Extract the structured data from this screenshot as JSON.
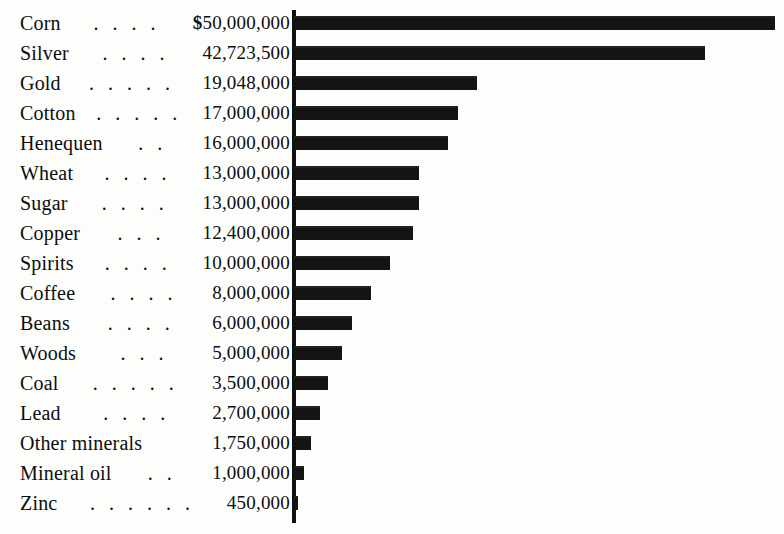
{
  "chart_data": {
    "type": "bar",
    "orientation": "horizontal",
    "title": "",
    "subtitle": "",
    "xlabel": "",
    "ylabel": "",
    "currency_symbol": "$",
    "xlim": [
      0,
      50000000
    ],
    "grid": false,
    "legend": false,
    "axis_baseline_color": "#141414",
    "bar_color": "#141414",
    "categories": [
      "Corn",
      "Silver",
      "Gold",
      "Cotton",
      "Henequen",
      "Wheat",
      "Sugar",
      "Copper",
      "Spirits",
      "Coffee",
      "Beans",
      "Woods",
      "Coal",
      "Lead",
      "Other minerals",
      "Mineral oil",
      "Zinc"
    ],
    "values": [
      50000000,
      42723500,
      19048000,
      17000000,
      16000000,
      13000000,
      13000000,
      12400000,
      10000000,
      8000000,
      6000000,
      5000000,
      3500000,
      2700000,
      1750000,
      1000000,
      450000
    ],
    "value_labels": [
      "50,000,000",
      "42,723,500",
      "19,048,000",
      "17,000,000",
      "16,000,000",
      "13,000,000",
      "13,000,000",
      "12,400,000",
      "10,000,000",
      "8,000,000",
      "6,000,000",
      "5,000,000",
      "3,500,000",
      "2,700,000",
      "1,750,000",
      "1,000,000",
      "450,000"
    ],
    "leader_dots": [
      ". . . .",
      ". . . .",
      ". . . . .",
      ". . . . .",
      ". .",
      ". . . .",
      ". . . .",
      ". . .",
      ". . . .",
      ". . . .",
      ". . . .",
      ". . .",
      ". . . . .",
      ". . . .",
      "",
      ". .",
      ". . . . . ."
    ],
    "rows": [
      {
        "label": "Corn",
        "leaders": ". . . .",
        "currency": "$",
        "value_label": "50,000,000",
        "value": 50000000
      },
      {
        "label": "Silver",
        "leaders": ". . . .",
        "currency": "",
        "value_label": "42,723,500",
        "value": 42723500
      },
      {
        "label": "Gold",
        "leaders": ". . . . .",
        "currency": "",
        "value_label": "19,048,000",
        "value": 19048000
      },
      {
        "label": "Cotton",
        "leaders": ". . . . .",
        "currency": "",
        "value_label": "17,000,000",
        "value": 17000000
      },
      {
        "label": "Henequen",
        "leaders": ". .",
        "currency": "",
        "value_label": "16,000,000",
        "value": 16000000
      },
      {
        "label": "Wheat",
        "leaders": ". . . .",
        "currency": "",
        "value_label": "13,000,000",
        "value": 13000000
      },
      {
        "label": "Sugar",
        "leaders": ". . . .",
        "currency": "",
        "value_label": "13,000,000",
        "value": 13000000
      },
      {
        "label": "Copper",
        "leaders": ". . .",
        "currency": "",
        "value_label": "12,400,000",
        "value": 12400000
      },
      {
        "label": "Spirits",
        "leaders": ". . . .",
        "currency": "",
        "value_label": "10,000,000",
        "value": 10000000
      },
      {
        "label": "Coffee",
        "leaders": ". . . .",
        "currency": "",
        "value_label": "8,000,000",
        "value": 8000000
      },
      {
        "label": "Beans",
        "leaders": ". . . .",
        "currency": "",
        "value_label": "6,000,000",
        "value": 6000000
      },
      {
        "label": "Woods",
        "leaders": ". . .",
        "currency": "",
        "value_label": "5,000,000",
        "value": 5000000
      },
      {
        "label": "Coal",
        "leaders": ". . . . .",
        "currency": "",
        "value_label": "3,500,000",
        "value": 3500000
      },
      {
        "label": "Lead",
        "leaders": ". . . .",
        "currency": "",
        "value_label": "2,700,000",
        "value": 2700000
      },
      {
        "label": "Other minerals",
        "leaders": "",
        "currency": "",
        "value_label": "1,750,000",
        "value": 1750000
      },
      {
        "label": "Mineral oil",
        "leaders": ". .",
        "currency": "",
        "value_label": "1,000,000",
        "value": 1000000
      },
      {
        "label": "Zinc",
        "leaders": ". . . . . .",
        "currency": "",
        "value_label": "450,000",
        "value": 450000
      }
    ]
  },
  "layout": {
    "axis_x_px": 292,
    "row_pitch_px": 30,
    "first_row_top_px": 8,
    "bar_height_px": 14,
    "px_per_unit": 9.6e-06
  }
}
